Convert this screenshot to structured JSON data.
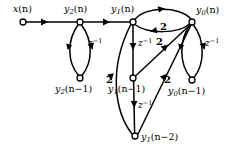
{
  "figure": {
    "width": 238,
    "height": 151,
    "background": "#ffffff",
    "ink": "#000000"
  },
  "nodes": [
    {
      "id": "x_n",
      "label": "x(n)",
      "base": "x",
      "sub": "",
      "arg": "(n)",
      "x": 23,
      "y": 22,
      "label_x": 13,
      "label_y": 4,
      "r": 3.0
    },
    {
      "id": "y2_n",
      "label": "y2(n)",
      "base": "y",
      "sub": "2",
      "arg": "(n)",
      "x": 80,
      "y": 22,
      "label_x": 64,
      "label_y": 4,
      "r": 3.0
    },
    {
      "id": "y1_n",
      "label": "y1(n)",
      "base": "y",
      "sub": "1",
      "arg": "(n)",
      "x": 133,
      "y": 22,
      "label_x": 111,
      "label_y": 4,
      "r": 3.0
    },
    {
      "id": "y0_n",
      "label": "y0(n)",
      "base": "y",
      "sub": "0",
      "arg": "(n)",
      "x": 192,
      "y": 22,
      "label_x": 196,
      "label_y": 5,
      "r": 3.0
    },
    {
      "id": "y2_n1",
      "label": "y2(n-1)",
      "base": "y",
      "sub": "2",
      "arg": "(n−1)",
      "x": 80,
      "y": 78,
      "label_x": 55,
      "label_y": 84,
      "r": 3.0
    },
    {
      "id": "y1_n1",
      "label": "y1(n-1)",
      "base": "y",
      "sub": "1",
      "arg": "(n−1)",
      "x": 133,
      "y": 78,
      "label_x": 108,
      "label_y": 84,
      "r": 3.0
    },
    {
      "id": "y0_n1",
      "label": "y0(n-1)",
      "base": "y",
      "sub": "0",
      "arg": "(n−1)",
      "x": 192,
      "y": 80,
      "label_x": 168,
      "label_y": 86,
      "r": 3.0
    },
    {
      "id": "y1_n2",
      "label": "y1(n-2)",
      "base": "y",
      "sub": "1",
      "arg": "(n−2)",
      "x": 135,
      "y": 136,
      "label_x": 141,
      "label_y": 132,
      "r": 3.0
    }
  ],
  "gain_labels": [
    {
      "id": "g_top",
      "text": "2",
      "x": 160,
      "y": 22
    },
    {
      "id": "g_mid",
      "text": "2",
      "x": 156,
      "y": 37
    },
    {
      "id": "g_left",
      "text": "2",
      "x": 106,
      "y": 75
    },
    {
      "id": "g_right",
      "text": "2",
      "x": 164,
      "y": 75
    }
  ],
  "delay_labels": [
    {
      "id": "d_left",
      "text": "z",
      "sup": "−1",
      "x": 88,
      "y": 38
    },
    {
      "id": "d_center",
      "text": "z",
      "sup": "−1",
      "x": 138,
      "y": 38
    },
    {
      "id": "d_right",
      "text": "z",
      "sup": "−1",
      "x": 205,
      "y": 38
    },
    {
      "id": "d_lower",
      "text": "z",
      "sup": "−1",
      "x": 138,
      "y": 100
    }
  ],
  "edges": [
    {
      "id": "e_x_to_y2",
      "from": "x_n",
      "to": "y2_n",
      "gain": "1",
      "kind": "straight"
    },
    {
      "id": "e_y2_to_y1",
      "from": "y2_n",
      "to": "y1_n",
      "gain": "1",
      "kind": "straight"
    },
    {
      "id": "e_y2n_to_y2n1",
      "from": "y2_n",
      "to": "y2_n1",
      "gain": "z^-1",
      "kind": "arc-right"
    },
    {
      "id": "e_y2n1_to_y2n",
      "from": "y2_n1",
      "to": "y2_n",
      "gain": "1",
      "kind": "arc-left"
    },
    {
      "id": "e_y1n_to_y1n1",
      "from": "y1_n",
      "to": "y1_n1",
      "gain": "z^-1",
      "kind": "straight"
    },
    {
      "id": "e_y1n1_to_y1n2",
      "from": "y1_n1",
      "to": "y1_n2",
      "gain": "z^-1",
      "kind": "straight"
    },
    {
      "id": "e_y1n_to_y0n",
      "from": "y1_n",
      "to": "y0_n",
      "gain": "1",
      "kind": "arc-top"
    },
    {
      "id": "e_y0n_to_y1n",
      "from": "y0_n",
      "to": "y1_n",
      "gain": "2",
      "kind": "arc-return"
    },
    {
      "id": "e_y0n_to_y0n1",
      "from": "y0_n",
      "to": "y0_n1",
      "gain": "z^-1",
      "kind": "arc-right"
    },
    {
      "id": "e_y0n1_to_y0n",
      "from": "y0_n1",
      "to": "y0_n",
      "gain": "1",
      "kind": "arc-left"
    },
    {
      "id": "e_y1n1_to_y0n",
      "from": "y1_n1",
      "to": "y0_n",
      "gain": "2",
      "kind": "diagonal"
    },
    {
      "id": "e_y1n2_to_y0n",
      "from": "y1_n2",
      "to": "y0_n",
      "gain": "2",
      "kind": "diagonal"
    },
    {
      "id": "e_y1n2_to_y1n",
      "from": "y1_n2",
      "to": "y1_n",
      "gain": "2",
      "kind": "diagonal-curved"
    }
  ]
}
